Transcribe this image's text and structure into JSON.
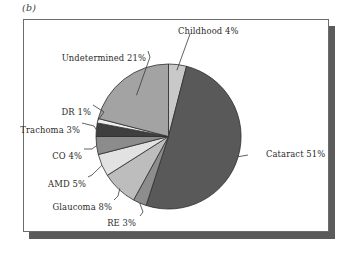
{
  "figure": {
    "panel_caption": "(b)",
    "frame_color": "#6d6d6d",
    "shadow_color": "#5b5b5b",
    "background_color": "#ffffff"
  },
  "chart_data": {
    "type": "pie",
    "title": "",
    "subtitle": "",
    "xlabel": "",
    "ylabel": "",
    "legend_position": "none",
    "grid": false,
    "start_angle_deg": 0,
    "direction": "clockwise",
    "units": "percent",
    "categories": [
      "Childhood",
      "Cataract",
      "RE",
      "Glaucoma",
      "AMD",
      "CO",
      "Trachoma",
      "DR",
      "Undetermined"
    ],
    "values": [
      4,
      51,
      3,
      8,
      5,
      4,
      3,
      1,
      21
    ],
    "labels": [
      "Childhood 4%",
      "Cataract 51%",
      "RE 3%",
      "Glaucoma 8%",
      "AMD 5%",
      "CO 4%",
      "Trachoma 3%",
      "DR 1%",
      "Undetermined 21%"
    ],
    "colors": [
      "#c9c9c9",
      "#595959",
      "#8d8d8d",
      "#bdbdbd",
      "#e2e2e2",
      "#8c8c8c",
      "#3f3f3f",
      "#efefef",
      "#a3a3a3"
    ],
    "slices": [
      {
        "name": "Childhood",
        "label": "Childhood 4%",
        "value": 4,
        "color": "#c9c9c9"
      },
      {
        "name": "Cataract",
        "label": "Cataract 51%",
        "value": 51,
        "color": "#595959"
      },
      {
        "name": "RE",
        "label": "RE 3%",
        "value": 3,
        "color": "#8d8d8d"
      },
      {
        "name": "Glaucoma",
        "label": "Glaucoma 8%",
        "value": 8,
        "color": "#bdbdbd"
      },
      {
        "name": "AMD",
        "label": "AMD 5%",
        "value": 5,
        "color": "#e2e2e2"
      },
      {
        "name": "CO",
        "label": "CO 4%",
        "value": 4,
        "color": "#8c8c8c"
      },
      {
        "name": "Trachoma",
        "label": "Trachoma 3%",
        "value": 3,
        "color": "#3f3f3f"
      },
      {
        "name": "DR",
        "label": "DR 1%",
        "value": 1,
        "color": "#efefef"
      },
      {
        "name": "Undetermined",
        "label": "Undetermined 21%",
        "value": 21,
        "color": "#a3a3a3"
      }
    ]
  }
}
